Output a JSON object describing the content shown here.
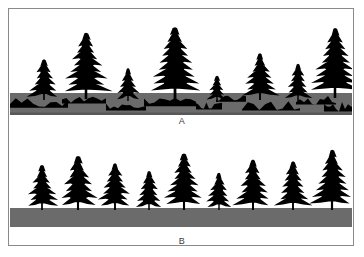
{
  "figure": {
    "background_color": "#ffffff",
    "frame_color": "#8a8a8a",
    "width": 364,
    "height": 257
  },
  "panels": [
    {
      "id": "A",
      "label": "A",
      "caption_text": "A",
      "description": "Forested slope with patchy, eroded soil layer shown as irregular dark gaps in the gray soil band; trees of mixed heights stand on uneven ground.",
      "soil": {
        "type": "patchy",
        "band_color": "#6b6b6b",
        "patch_color": "#000000",
        "band_top": 83,
        "band_height": 22
      },
      "tree_color": "#000000",
      "trees": [
        {
          "x": 34,
          "base_y": 90,
          "height": 46,
          "width": 30
        },
        {
          "x": 76,
          "base_y": 89,
          "height": 72,
          "width": 46
        },
        {
          "x": 118,
          "base_y": 91,
          "height": 38,
          "width": 24
        },
        {
          "x": 165,
          "base_y": 89,
          "height": 78,
          "width": 50
        },
        {
          "x": 207,
          "base_y": 92,
          "height": 30,
          "width": 20
        },
        {
          "x": 250,
          "base_y": 90,
          "height": 52,
          "width": 34
        },
        {
          "x": 288,
          "base_y": 91,
          "height": 42,
          "width": 26
        },
        {
          "x": 325,
          "base_y": 88,
          "height": 76,
          "width": 46
        }
      ]
    },
    {
      "id": "B",
      "label": "B",
      "caption_text": "B",
      "description": "Forested slope with a continuous, intact soil layer shown as a solid uniform gray band; trees of mixed heights stand on even ground.",
      "soil": {
        "type": "continuous",
        "band_color": "#6b6b6b",
        "patch_color": "#000000",
        "band_top": 72,
        "band_height": 19
      },
      "tree_color": "#000000",
      "trees": [
        {
          "x": 32,
          "base_y": 74,
          "height": 50,
          "width": 32
        },
        {
          "x": 68,
          "base_y": 74,
          "height": 60,
          "width": 38
        },
        {
          "x": 105,
          "base_y": 74,
          "height": 52,
          "width": 34
        },
        {
          "x": 139,
          "base_y": 74,
          "height": 44,
          "width": 28
        },
        {
          "x": 174,
          "base_y": 74,
          "height": 62,
          "width": 38
        },
        {
          "x": 209,
          "base_y": 74,
          "height": 42,
          "width": 26
        },
        {
          "x": 243,
          "base_y": 74,
          "height": 56,
          "width": 36
        },
        {
          "x": 283,
          "base_y": 74,
          "height": 54,
          "width": 34
        },
        {
          "x": 322,
          "base_y": 74,
          "height": 66,
          "width": 40
        }
      ]
    }
  ]
}
